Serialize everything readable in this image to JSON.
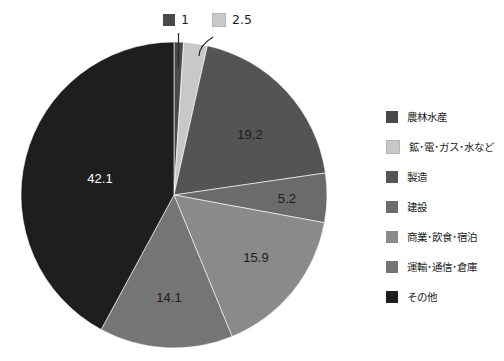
{
  "chart_data": {
    "type": "pie",
    "title": "",
    "unit": "%",
    "legend_position": "right",
    "categories": [
      "農林水産",
      "鉱･電･ガス･水など",
      "製造",
      "建設",
      "商業･飲食･宿泊",
      "運輸･通信･倉庫",
      "その他"
    ],
    "values": [
      1,
      2.5,
      19.2,
      5.2,
      15.9,
      14.1,
      42.1
    ],
    "colors": [
      "#4a4a4a",
      "#c8c8c8",
      "#545454",
      "#6b6b6b",
      "#8a8a8a",
      "#757575",
      "#1e1e1e"
    ],
    "labels": [
      "1",
      "2.5",
      "19.2",
      "5.2",
      "15.9",
      "14.1",
      "42.1"
    ],
    "label_placement": [
      "callout",
      "callout",
      "inside",
      "inside",
      "inside",
      "inside",
      "inside"
    ],
    "start_angle_deg": -90,
    "direction": "clockwise"
  },
  "legend": {
    "items": [
      {
        "label": "農林水産",
        "color": "#4a4a4a"
      },
      {
        "label": "鉱･電･ガス･水など",
        "color": "#c8c8c8"
      },
      {
        "label": "製造",
        "color": "#545454"
      },
      {
        "label": "建設",
        "color": "#6b6b6b"
      },
      {
        "label": "商業･飲食･宿泊",
        "color": "#8a8a8a"
      },
      {
        "label": "運輸･通信･倉庫",
        "color": "#757575"
      },
      {
        "label": "その他",
        "color": "#1e1e1e"
      }
    ]
  },
  "callouts": [
    {
      "label": "1",
      "color": "#4a4a4a"
    },
    {
      "label": "2.5",
      "color": "#c8c8c8"
    }
  ],
  "slice_labels": [
    {
      "text": "19.2",
      "x": 250,
      "y": 139,
      "color": "#1c1c1c"
    },
    {
      "text": "5.2",
      "x": 287,
      "y": 203,
      "color": "#1c1c1c"
    },
    {
      "text": "15.9",
      "x": 256,
      "y": 262,
      "color": "#1c1c1c"
    },
    {
      "text": "14.1",
      "x": 169,
      "y": 302,
      "color": "#1c1c1c"
    },
    {
      "text": "42.1",
      "x": 100,
      "y": 183,
      "color": "#ffffff"
    }
  ]
}
